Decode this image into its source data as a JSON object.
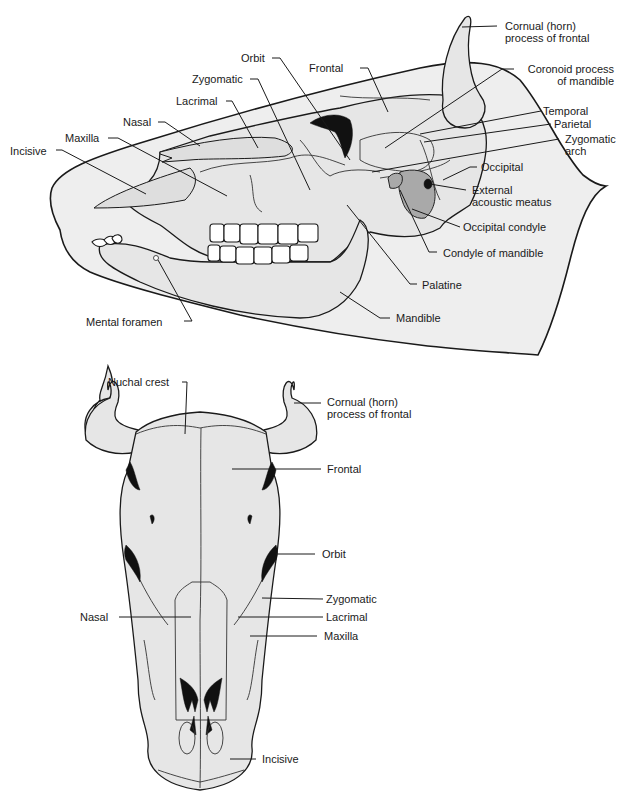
{
  "figure": {
    "lateral_view": {
      "labels": [
        {
          "id": "incisive",
          "text": "Incisive"
        },
        {
          "id": "maxilla",
          "text": "Maxilla"
        },
        {
          "id": "nasal",
          "text": "Nasal"
        },
        {
          "id": "lacrimal",
          "text": "Lacrimal"
        },
        {
          "id": "zygomatic",
          "text": "Zygomatic"
        },
        {
          "id": "orbit",
          "text": "Orbit"
        },
        {
          "id": "frontal",
          "text": "Frontal"
        },
        {
          "id": "cornual",
          "text": "Cornual (horn)\nprocess of frontal"
        },
        {
          "id": "coronoid",
          "text": "Coronoid process\nof mandible"
        },
        {
          "id": "temporal",
          "text": "Temporal"
        },
        {
          "id": "parietal",
          "text": "Parietal"
        },
        {
          "id": "zygomatic_arch",
          "text": "Zygomatic\narch"
        },
        {
          "id": "occipital",
          "text": "Occipital"
        },
        {
          "id": "external_acoustic_meatus",
          "text": "External\nacoustic meatus"
        },
        {
          "id": "occipital_condyle",
          "text": "Occipital condyle"
        },
        {
          "id": "condyle_of_mandible",
          "text": "Condyle of mandible"
        },
        {
          "id": "palatine",
          "text": "Palatine"
        },
        {
          "id": "mandible",
          "text": "Mandible"
        },
        {
          "id": "mental_foramen",
          "text": "Mental foramen"
        }
      ]
    },
    "dorsal_view": {
      "labels": [
        {
          "id": "nuchal_crest",
          "text": "Nuchal crest"
        },
        {
          "id": "cornual",
          "text": "Cornual (horn)\nprocess of frontal"
        },
        {
          "id": "frontal",
          "text": "Frontal"
        },
        {
          "id": "orbit",
          "text": "Orbit"
        },
        {
          "id": "zygomatic",
          "text": "Zygomatic"
        },
        {
          "id": "nasal",
          "text": "Nasal"
        },
        {
          "id": "lacrimal",
          "text": "Lacrimal"
        },
        {
          "id": "maxilla",
          "text": "Maxilla"
        },
        {
          "id": "incisive",
          "text": "Incisive"
        }
      ]
    }
  }
}
